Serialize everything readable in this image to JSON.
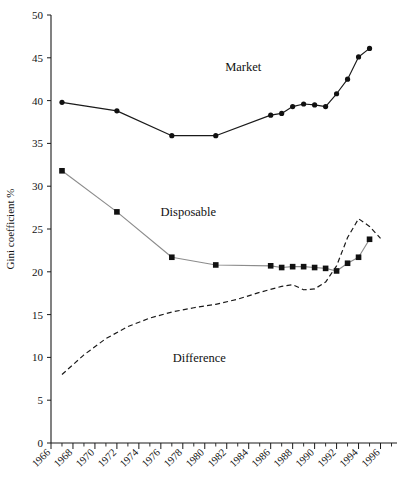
{
  "chart_data": {
    "type": "line",
    "title": "",
    "xlabel": "",
    "ylabel": "Gini coefficient %",
    "xlim": [
      1966,
      1997.5
    ],
    "ylim": [
      0,
      50
    ],
    "grid": false,
    "legend_position": "inline-annotations",
    "x_ticks": [
      "1966",
      "1968",
      "1970",
      "1972",
      "1974",
      "1976",
      "1978",
      "1980",
      "1982",
      "1984",
      "1986",
      "1988",
      "1990",
      "1992",
      "1994",
      "1996"
    ],
    "x_tick_values": [
      1966,
      1968,
      1970,
      1972,
      1974,
      1976,
      1978,
      1980,
      1982,
      1984,
      1986,
      1988,
      1990,
      1992,
      1994,
      1996
    ],
    "y_ticks": [
      "0",
      "5",
      "10",
      "15",
      "20",
      "25",
      "30",
      "35",
      "40",
      "45",
      "50"
    ],
    "y_tick_values": [
      0,
      5,
      10,
      15,
      20,
      25,
      30,
      35,
      40,
      45,
      50
    ],
    "series": [
      {
        "name": "Market",
        "label": "Market",
        "label_x": 1983.5,
        "label_y": 43.5,
        "style": "solid",
        "color": "#1a1a1a",
        "marker": "circle",
        "x": [
          1967,
          1972,
          1977,
          1981,
          1986,
          1987,
          1988,
          1989,
          1990,
          1991,
          1992,
          1993,
          1994,
          1995
        ],
        "values": [
          39.8,
          38.8,
          35.9,
          35.9,
          38.3,
          38.5,
          39.3,
          39.6,
          39.5,
          39.3,
          40.8,
          42.5,
          45.1,
          46.1
        ]
      },
      {
        "name": "Disposable",
        "label": "Disposable",
        "label_x": 1978.5,
        "label_y": 26.5,
        "style": "solid",
        "color": "#8c8c8c",
        "marker": "square",
        "x": [
          1967,
          1972,
          1977,
          1981,
          1986,
          1987,
          1988,
          1989,
          1990,
          1991,
          1992,
          1993,
          1994,
          1995
        ],
        "values": [
          31.8,
          27.0,
          21.7,
          20.8,
          20.7,
          20.5,
          20.6,
          20.6,
          20.5,
          20.4,
          20.1,
          21.0,
          21.7,
          23.8
        ]
      },
      {
        "name": "Difference",
        "label": "Difference",
        "label_x": 1979.5,
        "label_y": 9.5,
        "style": "dashed",
        "color": "#1a1a1a",
        "marker": "none",
        "x": [
          1967,
          1969,
          1971,
          1973,
          1975,
          1977,
          1979,
          1981,
          1983,
          1985,
          1987,
          1988,
          1989,
          1990,
          1991,
          1992,
          1993,
          1994,
          1995,
          1996
        ],
        "values": [
          8.0,
          10.3,
          12.2,
          13.6,
          14.6,
          15.3,
          15.8,
          16.2,
          16.8,
          17.6,
          18.3,
          18.5,
          17.9,
          18.0,
          18.8,
          20.7,
          24.0,
          26.2,
          25.3,
          23.9
        ]
      }
    ]
  }
}
